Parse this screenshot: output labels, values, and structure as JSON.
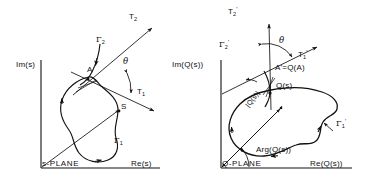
{
  "figure": {
    "type": "conformal-mapping-diagram",
    "panels": [
      {
        "id": "s-plane",
        "plane_label": "s-PLANE",
        "axis_y": "Im(s)",
        "axis_x": "Re(s)",
        "point_labels": [
          "A",
          "S"
        ],
        "tangent_labels": [
          "T2",
          "T1"
        ],
        "contour_labels": [
          "Γ2",
          "Γ1"
        ],
        "angle_label": "θ"
      },
      {
        "id": "q-plane",
        "plane_label": "Q-PLANE",
        "axis_y": "Im(Q(s))",
        "axis_x": "Re(Q(s))",
        "point_labels": [
          "A'=Q(A)",
          "Q(s)"
        ],
        "tangent_labels": [
          "T2'",
          "T1'"
        ],
        "contour_labels": [
          "Γ'2",
          "Γ'1"
        ],
        "angle_label": "θ",
        "magnitude_label": "|Q(s)|",
        "argument_label": "Arg(Q(s))"
      }
    ]
  },
  "left": {
    "axis_y": "Im(s)",
    "axis_x": "Re(s)",
    "plane": "s-PLANE",
    "point_a": "A",
    "point_s": "S",
    "t2_base": "T",
    "t2_sub": "2",
    "t1_base": "T",
    "t1_sub": "1",
    "g2_base": "Γ",
    "g2_sub": "2",
    "g1_base": "Γ",
    "g1_sub": "1",
    "theta": "θ"
  },
  "right": {
    "axis_y": "Im(Q(s))",
    "axis_x": "Re(Q(s))",
    "plane": "Q-PLANE",
    "point_a": "A'=Q(A)",
    "point_qs": "Q(s)",
    "t2_base": "T",
    "t2_sub": "2",
    "t2_prime": "′",
    "t1_base": "T",
    "t1_sub": "1",
    "t1_prime": "′",
    "g2_base": "Γ",
    "g2_sub": "2",
    "g2_prime": "′",
    "g1_base": "Γ",
    "g1_sub": "1",
    "g1_prime": "′",
    "theta": "θ",
    "magnitude": "|Q(s)|",
    "argument": "Arg(Q(s))"
  },
  "colors": {
    "ink": "#111111",
    "background": "#ffffff"
  }
}
